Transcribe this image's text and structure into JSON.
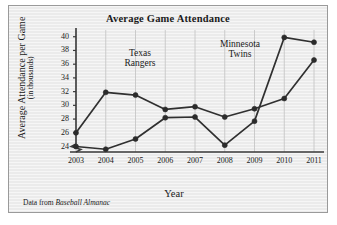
{
  "chart_data": {
    "type": "line",
    "title": "Average Game Attendance",
    "xlabel": "Year",
    "ylabel": "Average Attendance per Game",
    "ylabel_sub": "(in thousands)",
    "x": [
      "2003",
      "2004",
      "2005",
      "2006",
      "2007",
      "2008",
      "2009",
      "2010",
      "2011"
    ],
    "categories": [
      "2003",
      "2004",
      "2005",
      "2006",
      "2007",
      "2008",
      "2009",
      "2010",
      "2011"
    ],
    "yticks": [
      24,
      26,
      28,
      30,
      32,
      34,
      36,
      38,
      40
    ],
    "ylim": [
      23.2,
      40.4
    ],
    "axis_break": true,
    "grid": "vertical",
    "legend_position": "inline-annotations",
    "series": [
      {
        "name": "Texas Rangers",
        "values": [
          26.0,
          31.9,
          31.5,
          29.4,
          29.8,
          28.3,
          29.5,
          31.0,
          36.6
        ]
      },
      {
        "name": "Minnesota Twins",
        "values": [
          24.0,
          23.6,
          25.1,
          28.2,
          28.3,
          24.2,
          27.7,
          39.9,
          39.2
        ]
      }
    ],
    "annotations": [
      {
        "text_line1": "Texas",
        "text_line2": "Rangers"
      },
      {
        "text_line1": "Minnesota",
        "text_line2": "Twins"
      }
    ],
    "source_prefix": "Data from ",
    "source_italic": "Baseball Almanac",
    "colors": {
      "line": "#303030",
      "marker": "#2b2b2b",
      "axis": "#3a3a3a",
      "grid": "#c2c2c2",
      "background": "#ebebeb",
      "text": "#1a1a1a"
    }
  }
}
